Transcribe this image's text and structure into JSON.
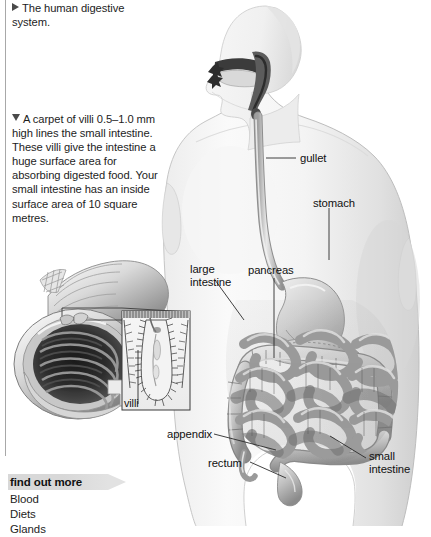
{
  "page": {
    "title": "The human digestive system",
    "background_color": "#ffffff"
  },
  "captions": {
    "top": {
      "marker": "right-triangle",
      "text": "The human digestive system."
    },
    "villi": {
      "marker": "down-triangle",
      "text": "A carpet of villi 0.5–1.0 mm high lines the small intestine. These villi give the intestine a huge surface area for absorbing digested food. Your small intestine has an inside surface area of 10 square metres."
    }
  },
  "find_out_more": {
    "heading": "find out more",
    "banner_color": "#d8d8d8",
    "items": [
      "Blood",
      "Diets",
      "Glands"
    ]
  },
  "diagram": {
    "type": "anatomical-illustration",
    "subject": "human digestive system",
    "labels": [
      {
        "id": "gullet",
        "text": "gullet"
      },
      {
        "id": "stomach",
        "text": "stomach"
      },
      {
        "id": "pancreas",
        "text": "pancreas"
      },
      {
        "id": "large-intestine",
        "text": "large\nintestine"
      },
      {
        "id": "appendix",
        "text": "appendix"
      },
      {
        "id": "rectum",
        "text": "rectum"
      },
      {
        "id": "small-intestine",
        "text": "small\nintestine"
      },
      {
        "id": "villi",
        "text": "villi"
      }
    ]
  },
  "colors": {
    "text": "#1a1a1a",
    "rule": "#a8a8a8",
    "organ_light": "#d4d4d4",
    "organ_mid": "#a9a9a9",
    "organ_dark": "#6b6b6b",
    "body_fill": "#f1f1f1",
    "body_edge": "#c9c9c9"
  }
}
